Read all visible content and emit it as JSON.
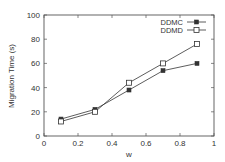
{
  "chart_data": {
    "type": "line",
    "title": "",
    "xlabel": "w",
    "ylabel": "Migration Time (s)",
    "xlim": [
      0,
      1
    ],
    "ylim": [
      0,
      100
    ],
    "xticks": [
      0,
      0.2,
      0.4,
      0.6,
      0.8,
      1
    ],
    "xtick_labels": [
      "0",
      "0.2",
      "0.4",
      "0.6",
      "0.8",
      "1"
    ],
    "yticks": [
      0,
      20,
      40,
      60,
      80,
      100
    ],
    "ytick_labels": [
      "0",
      "20",
      "40",
      "60",
      "80",
      "100"
    ],
    "grid": false,
    "legend_position": "upper right",
    "x": [
      0.1,
      0.3,
      0.5,
      0.7,
      0.9
    ],
    "series": [
      {
        "name": "DDMC",
        "marker": "filled-square",
        "line": "solid",
        "color": "#333333",
        "values": [
          14,
          22,
          38,
          54,
          60
        ]
      },
      {
        "name": "DDMD",
        "marker": "open-square",
        "line": "solid",
        "color": "#333333",
        "values": [
          12,
          20,
          44,
          60,
          76
        ]
      }
    ]
  }
}
